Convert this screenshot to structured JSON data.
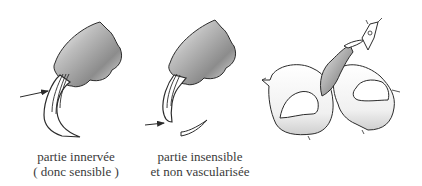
{
  "figure": {
    "panels": [
      {
        "id": "claw-innervated",
        "caption": [
          "partie innervée",
          "( donc sensible )"
        ],
        "arrow_target": "quick"
      },
      {
        "id": "claw-trimmed",
        "caption": [
          "partie insensible",
          "et non vascularisée"
        ],
        "arrow_target": "cut-point"
      },
      {
        "id": "paw-with-clipper",
        "caption": []
      }
    ]
  },
  "colors": {
    "line": "#2b2b2b",
    "shade_dark": "#8a8a8a",
    "shade_light": "#f4f4f4",
    "text": "#3a3a3a"
  }
}
